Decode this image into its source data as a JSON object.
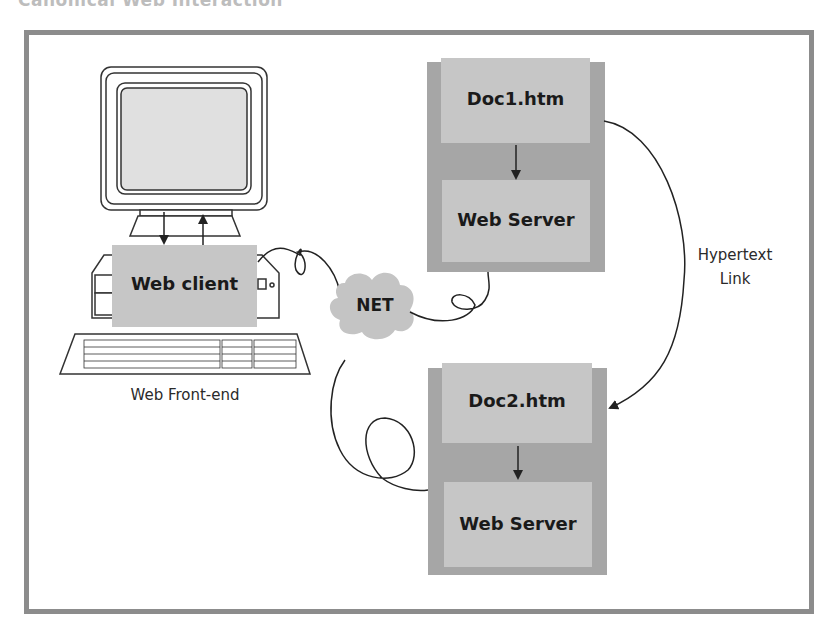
{
  "title": "Canonical Web Interaction",
  "client": {
    "box_label": "Web client",
    "caption": "Web Front-end"
  },
  "network": {
    "label": "NET"
  },
  "server1": {
    "doc_label": "Doc1.htm",
    "server_label": "Web Server"
  },
  "server2": {
    "doc_label": "Doc2.htm",
    "server_label": "Web Server"
  },
  "link": {
    "label_line1": "Hypertext",
    "label_line2": "Link"
  },
  "colors": {
    "frame": "#8c8c8c",
    "box_dark": "#a6a6a6",
    "box_light": "#c6c6c6",
    "cloud": "#c4c4c4",
    "line": "#222222"
  }
}
